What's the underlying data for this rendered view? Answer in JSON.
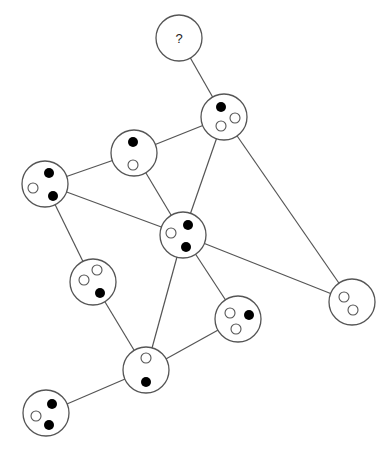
{
  "diagram": {
    "type": "graph",
    "node_radius": 23,
    "dot_radius": 5,
    "colors": {
      "stroke": "#555555",
      "filled_dot": "#000000",
      "empty_dot": "#ffffff",
      "background": "#ffffff"
    },
    "nodes": [
      {
        "id": "Q",
        "x": 179,
        "y": 38,
        "label": "?",
        "dots": []
      },
      {
        "id": "A",
        "x": 224,
        "y": 117,
        "label": "",
        "dots": [
          {
            "dx": -3,
            "dy": -10,
            "filled": true
          },
          {
            "dx": 11,
            "dy": 1,
            "filled": false
          },
          {
            "dx": -3,
            "dy": 9,
            "filled": false
          }
        ]
      },
      {
        "id": "B",
        "x": 134,
        "y": 153,
        "label": "",
        "dots": [
          {
            "dx": -1,
            "dy": -11,
            "filled": true
          },
          {
            "dx": -1,
            "dy": 12,
            "filled": false
          }
        ]
      },
      {
        "id": "C",
        "x": 45,
        "y": 184,
        "label": "",
        "dots": [
          {
            "dx": 4,
            "dy": -11,
            "filled": true
          },
          {
            "dx": -12,
            "dy": 4,
            "filled": false
          },
          {
            "dx": 8,
            "dy": 12,
            "filled": true
          }
        ]
      },
      {
        "id": "D",
        "x": 183,
        "y": 235,
        "label": "",
        "dots": [
          {
            "dx": 5,
            "dy": -10,
            "filled": true
          },
          {
            "dx": -12,
            "dy": -2,
            "filled": false
          },
          {
            "dx": 3,
            "dy": 12,
            "filled": true
          }
        ]
      },
      {
        "id": "E",
        "x": 93,
        "y": 282,
        "label": "",
        "dots": [
          {
            "dx": 4,
            "dy": -12,
            "filled": false
          },
          {
            "dx": -9,
            "dy": -2,
            "filled": false
          },
          {
            "dx": 7,
            "dy": 11,
            "filled": true
          }
        ]
      },
      {
        "id": "F",
        "x": 238,
        "y": 319,
        "label": "",
        "dots": [
          {
            "dx": -8,
            "dy": -6,
            "filled": false
          },
          {
            "dx": 11,
            "dy": -4,
            "filled": true
          },
          {
            "dx": -2,
            "dy": 10,
            "filled": false
          }
        ]
      },
      {
        "id": "G",
        "x": 352,
        "y": 302,
        "label": "",
        "dots": [
          {
            "dx": -8,
            "dy": -5,
            "filled": false
          },
          {
            "dx": 1,
            "dy": 8,
            "filled": false
          }
        ]
      },
      {
        "id": "H",
        "x": 146,
        "y": 370,
        "label": "",
        "dots": [
          {
            "dx": 0,
            "dy": -12,
            "filled": false
          },
          {
            "dx": 0,
            "dy": 12,
            "filled": true
          }
        ]
      },
      {
        "id": "I",
        "x": 46,
        "y": 413,
        "label": "",
        "dots": [
          {
            "dx": 6,
            "dy": -9,
            "filled": true
          },
          {
            "dx": -10,
            "dy": 3,
            "filled": false
          },
          {
            "dx": 3,
            "dy": 12,
            "filled": true
          }
        ]
      }
    ],
    "edges": [
      [
        "Q",
        "A"
      ],
      [
        "A",
        "B"
      ],
      [
        "A",
        "D"
      ],
      [
        "A",
        "G"
      ],
      [
        "B",
        "C"
      ],
      [
        "B",
        "D"
      ],
      [
        "C",
        "D"
      ],
      [
        "C",
        "E"
      ],
      [
        "D",
        "G"
      ],
      [
        "D",
        "F"
      ],
      [
        "D",
        "H"
      ],
      [
        "E",
        "H"
      ],
      [
        "F",
        "H"
      ],
      [
        "H",
        "I"
      ]
    ]
  }
}
